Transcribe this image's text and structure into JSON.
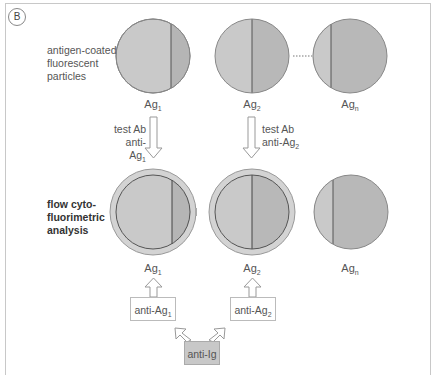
{
  "panel": {
    "label": "B"
  },
  "labels": {
    "particles": [
      "antigen-coated",
      "fluorescent",
      "particles"
    ],
    "analysis": [
      "flow cyto-",
      "fluorimetric",
      "analysis"
    ]
  },
  "top_row": [
    {
      "name": "Ag",
      "sub": "1"
    },
    {
      "name": "Ag",
      "sub": "2"
    },
    {
      "name": "Ag",
      "sub": "n"
    }
  ],
  "steps": [
    {
      "line1": "test Ab",
      "line2": "anti-Ag",
      "sub": "1"
    },
    {
      "line1": "test Ab",
      "line2": "anti-Ag",
      "sub": "2"
    }
  ],
  "bottom_row": [
    {
      "name": "Ag",
      "sub": "1"
    },
    {
      "name": "Ag",
      "sub": "2"
    },
    {
      "name": "Ag",
      "sub": "n"
    }
  ],
  "reagents": [
    {
      "name": "anti-Ag",
      "sub": "1"
    },
    {
      "name": "anti-Ag",
      "sub": "2"
    }
  ],
  "secondary": {
    "label": "anti-Ig"
  },
  "colors": {
    "particle_light": "#c9c9c9",
    "particle_dark": "#b5b5b5",
    "ring": "#d3d3d3",
    "outline": "#555555"
  }
}
